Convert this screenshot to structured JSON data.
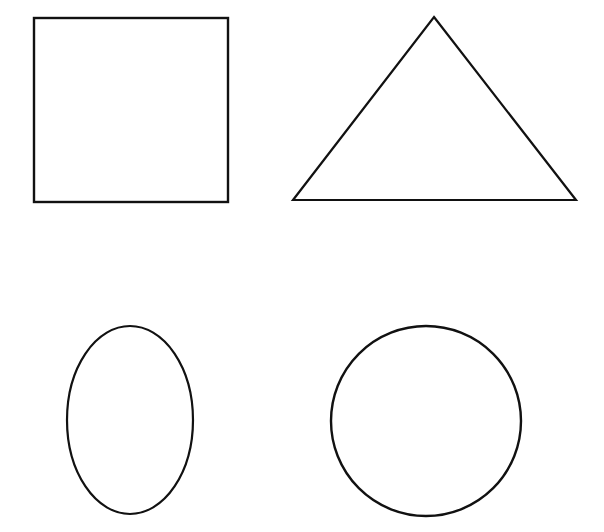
{
  "canvas": {
    "width": 604,
    "height": 532,
    "background_color": "#ffffff",
    "stroke_color": "#111111"
  },
  "figure": {
    "type": "geometric-shapes-sheet",
    "shape_count": 4,
    "layout": "2x2 grid of outlined plane figures on a blank white background",
    "has_text_labels": false
  },
  "shapes": [
    {
      "name": "square",
      "position": "top-left",
      "geometry": "rect",
      "x": 34,
      "y": 18,
      "width": 194,
      "height": 184,
      "stroke_width": 2.4,
      "stroke_color": "#111111",
      "fill": "none"
    },
    {
      "name": "triangle",
      "position": "top-right",
      "geometry": "polygon",
      "points": "434,17 576,200 293,200",
      "apex": [
        434,
        17
      ],
      "base_left": [
        293,
        200
      ],
      "base_right": [
        576,
        200
      ],
      "stroke_width": 2.2,
      "stroke_color": "#111111",
      "fill": "none"
    },
    {
      "name": "ellipse",
      "position": "bottom-left",
      "geometry": "ellipse",
      "cx": 130,
      "cy": 420,
      "rx": 63,
      "ry": 94,
      "stroke_width": 2.2,
      "stroke_color": "#111111",
      "fill": "none"
    },
    {
      "name": "circle",
      "position": "bottom-right",
      "geometry": "circle",
      "cx": 426,
      "cy": 421,
      "r": 95,
      "stroke_width": 2.4,
      "stroke_color": "#111111",
      "fill": "none"
    }
  ]
}
